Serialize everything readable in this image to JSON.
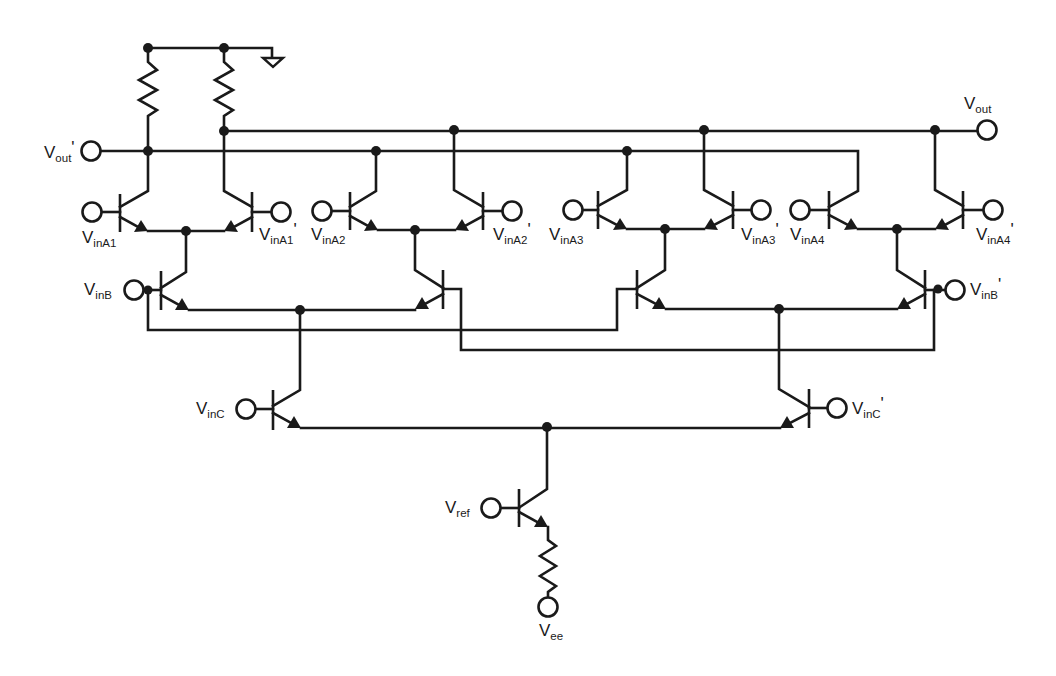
{
  "diagram": {
    "type": "circuit-schematic",
    "colors": {
      "ink": "#1a1a1a",
      "background": "#ffffff"
    },
    "ports": {
      "vout": {
        "main": "V",
        "sub": "out",
        "prime": ""
      },
      "vout_p": {
        "main": "V",
        "sub": "out",
        "prime": "'"
      },
      "vina1": {
        "main": "V",
        "sub": "inA1",
        "prime": ""
      },
      "vina1_p": {
        "main": "V",
        "sub": "inA1",
        "prime": "'"
      },
      "vina2": {
        "main": "V",
        "sub": "inA2",
        "prime": ""
      },
      "vina2_p": {
        "main": "V",
        "sub": "inA2",
        "prime": "'"
      },
      "vina3": {
        "main": "V",
        "sub": "inA3",
        "prime": ""
      },
      "vina3_p": {
        "main": "V",
        "sub": "inA3",
        "prime": "'"
      },
      "vina4": {
        "main": "V",
        "sub": "inA4",
        "prime": ""
      },
      "vina4_p": {
        "main": "V",
        "sub": "inA4",
        "prime": "'"
      },
      "vinb": {
        "main": "V",
        "sub": "inB",
        "prime": ""
      },
      "vinb_p": {
        "main": "V",
        "sub": "inB",
        "prime": "'"
      },
      "vinc": {
        "main": "V",
        "sub": "inC",
        "prime": ""
      },
      "vinc_p": {
        "main": "V",
        "sub": "inC",
        "prime": "'"
      },
      "vref": {
        "main": "V",
        "sub": "ref",
        "prime": ""
      },
      "vee": {
        "main": "V",
        "sub": "ee",
        "prime": ""
      }
    },
    "components": {
      "transistors": 15,
      "resistors": 3,
      "ground": 1,
      "transistor_type": "NPN"
    }
  }
}
